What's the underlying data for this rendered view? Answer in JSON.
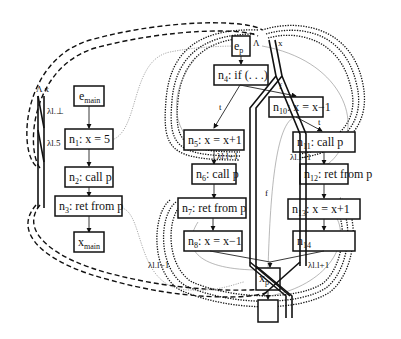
{
  "diagram": {
    "type": "interprocedural supergraph (exploded)",
    "main": {
      "nodes": [
        {
          "id": "e_main",
          "label": "e",
          "sub": "main"
        },
        {
          "id": "n1",
          "label": "n",
          "sub": "1",
          "text": ": x = 5"
        },
        {
          "id": "n2",
          "label": "n",
          "sub": "2",
          "text": ": call p"
        },
        {
          "id": "n3",
          "label": "n",
          "sub": "3",
          "text": ": ret from p"
        },
        {
          "id": "x_main",
          "label": "x",
          "sub": "main"
        }
      ]
    },
    "p": {
      "nodes": [
        {
          "id": "e_p",
          "label": "e",
          "sub": "p"
        },
        {
          "id": "n4",
          "label": "n",
          "sub": "4",
          "text": ": if (. . .)"
        },
        {
          "id": "n5",
          "label": "n",
          "sub": "5",
          "text": ": x = x+1"
        },
        {
          "id": "n6",
          "label": "n",
          "sub": "6",
          "text": ": call p"
        },
        {
          "id": "n7",
          "label": "n",
          "sub": "7",
          "text": ": ret from p"
        },
        {
          "id": "n8",
          "label": "n",
          "sub": "8",
          "text": ": x = x−1"
        },
        {
          "id": "n9",
          "label": "n",
          "sub": "9",
          "text": ": if (. . .)"
        },
        {
          "id": "n10",
          "label": "n",
          "sub": "10",
          "text": ": x = x−1"
        },
        {
          "id": "n11",
          "label": "n",
          "sub": "11",
          "text": ": call p"
        },
        {
          "id": "n12",
          "label": "n",
          "sub": "12",
          "text": ": ret from p"
        },
        {
          "id": "n13",
          "label": "n",
          "sub": "13",
          "text": ": x = x+1"
        },
        {
          "id": "n14",
          "label": "n",
          "sub": "14"
        },
        {
          "id": "x_p",
          "label": "x",
          "sub": "p"
        }
      ]
    },
    "edge_labels": {
      "t1": "t",
      "f1": "f",
      "t2": "t",
      "f2": "f",
      "lambda_header": "Λ x",
      "lambda_header_p_L": "Λ",
      "lambda_header_p_x": "x",
      "fn_bot": "λl.⊥",
      "fn_five": "λl.5",
      "fn_plus1_n5": "λl.l+1",
      "fn_minus1_n10": "λl.l−1",
      "fn_minus1_n8": "λl.l−1",
      "fn_plus1_n13": "λl.l+1"
    }
  }
}
